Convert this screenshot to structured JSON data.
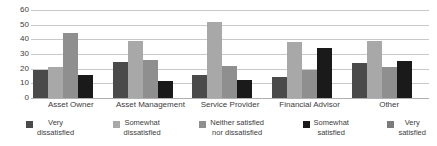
{
  "chart_data": {
    "type": "bar",
    "title": "",
    "subtitle": "",
    "xlabel": "",
    "ylabel": "",
    "ylim": [
      0,
      60
    ],
    "ytick_labels": [
      "60",
      "50",
      "40",
      "30",
      "20",
      "10",
      "0"
    ],
    "ytick_values": [
      60,
      50,
      40,
      30,
      20,
      10,
      0
    ],
    "grid": true,
    "legend_position": "bottom",
    "categories": [
      "Asset Owner",
      "Asset Management",
      "Service Provider",
      "Financial Advisor",
      "Other"
    ],
    "series": [
      {
        "name": "Very dissatisfied",
        "color": "#4a4a4a",
        "values": [
          19,
          24.5,
          16,
          14,
          24
        ]
      },
      {
        "name": "Somewhat dissatisfied",
        "color": "#a8a8a8",
        "values": [
          21,
          39,
          52,
          38,
          39
        ]
      },
      {
        "name": "Neither satisfied nor dissatisfied",
        "color": "#8f8f8f",
        "values": [
          44.5,
          26,
          22,
          19,
          21
        ]
      },
      {
        "name": "Somewhat satisfied",
        "color": "#1a1a1a",
        "values": [
          15.5,
          11.5,
          12.5,
          34,
          25
        ]
      },
      {
        "name": "Very satisfied",
        "color": "#7b7b7b",
        "values": [
          0,
          0,
          0,
          0,
          0
        ]
      }
    ]
  },
  "legend": {
    "items": [
      {
        "label": "Very\ndissatisfied",
        "swatch": "#4a4a4a"
      },
      {
        "label": "Somewhat\ndissatisfied",
        "swatch": "#a8a8a8"
      },
      {
        "label": "Neither satisfied\nnor dissatisfied",
        "swatch": "#8f8f8f"
      },
      {
        "label": "Somewhat\nsatisfied",
        "swatch": "#1a1a1a"
      },
      {
        "label": "Very\nsatisfied",
        "swatch": "#7b7b7b"
      }
    ]
  },
  "axis": {
    "y_ticks": [
      "60",
      "50",
      "40",
      "30",
      "20",
      "10",
      "0"
    ]
  },
  "colors": {
    "gridline": "#c9c9c9",
    "baseline": "#b0b0b0",
    "text": "#3d3d3d",
    "background": "#ffffff"
  }
}
